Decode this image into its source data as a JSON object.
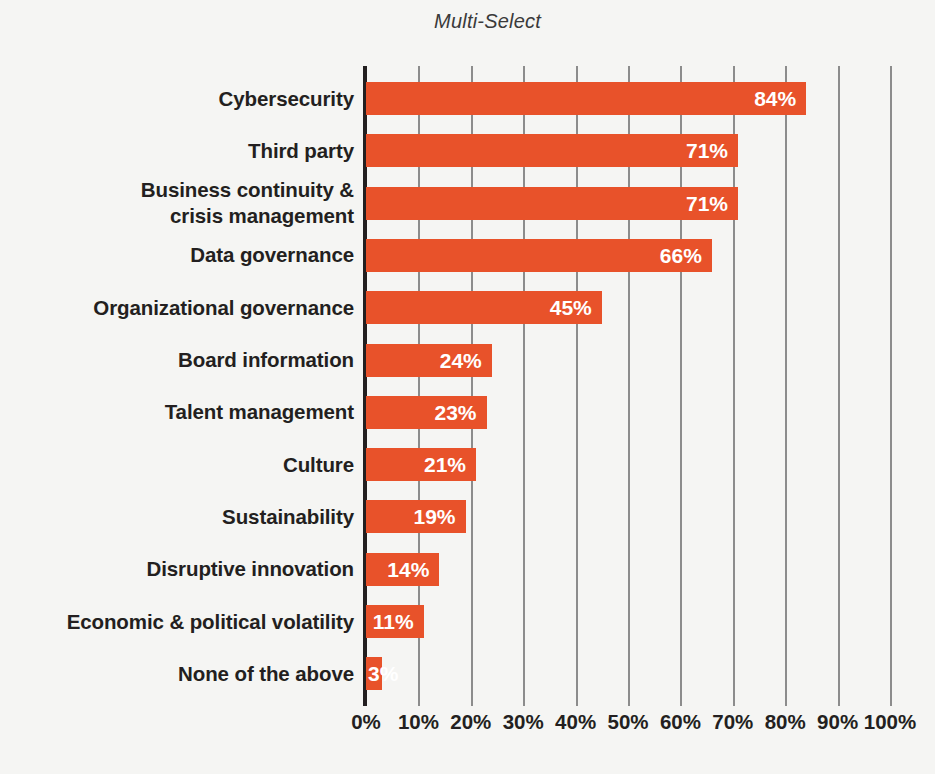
{
  "chart_data": {
    "type": "bar",
    "orientation": "horizontal",
    "title": "Multi-Select",
    "xlabel": "",
    "ylabel": "",
    "xlim": [
      0,
      100
    ],
    "grid": true,
    "legend": null,
    "value_suffix": "%",
    "bar_color": "#e8522a",
    "text_color": "#231f20",
    "value_label_color": "#ffffff",
    "background_color": "#f5f5f3",
    "gridline_color": "#8c8c8c",
    "axis_color": "#231f20",
    "categories": [
      "Cybersecurity",
      "Third party",
      "Business continuity & crisis management",
      "Data governance",
      "Organizational governance",
      "Board information",
      "Talent management",
      "Culture",
      "Sustainability",
      "Disruptive innovation",
      "Economic & political volatility",
      "None of the above"
    ],
    "category_lines": [
      [
        "Cybersecurity"
      ],
      [
        "Third party"
      ],
      [
        "Business continuity &",
        "crisis management"
      ],
      [
        "Data governance"
      ],
      [
        "Organizational governance"
      ],
      [
        "Board information"
      ],
      [
        "Talent management"
      ],
      [
        "Culture"
      ],
      [
        "Sustainability"
      ],
      [
        "Disruptive innovation"
      ],
      [
        "Economic & political volatility"
      ],
      [
        "None of the above"
      ]
    ],
    "values": [
      84,
      71,
      71,
      66,
      45,
      24,
      23,
      21,
      19,
      14,
      11,
      3
    ],
    "value_labels": [
      "84%",
      "71%",
      "71%",
      "66%",
      "45%",
      "24%",
      "23%",
      "21%",
      "19%",
      "14%",
      "11%",
      "3%"
    ],
    "xticks": [
      0,
      10,
      20,
      30,
      40,
      50,
      60,
      70,
      80,
      90,
      100
    ],
    "xtick_labels": [
      "0%",
      "10%",
      "20%",
      "30%",
      "40%",
      "50%",
      "60%",
      "70%",
      "80%",
      "90%",
      "100%"
    ]
  }
}
